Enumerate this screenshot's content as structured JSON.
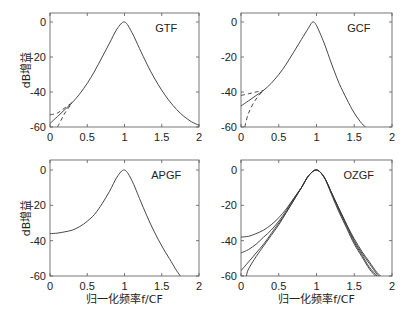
{
  "chart_data": [
    {
      "type": "line",
      "title": "GTF",
      "xlabel": "",
      "ylabel": "dB增益",
      "xlim": [
        0,
        2
      ],
      "ylim": [
        -60,
        5
      ],
      "xticks": [
        "0",
        "0.5",
        "1",
        "1.5",
        "2"
      ],
      "yticks": [
        "0",
        "-20",
        "-40",
        "-60"
      ],
      "grid": false,
      "series": [
        {
          "name": "solid",
          "style": "solid",
          "x": [
            0,
            0.1,
            0.2,
            0.3,
            0.4,
            0.5,
            0.6,
            0.7,
            0.8,
            0.9,
            1.0,
            1.1,
            1.2,
            1.3,
            1.4,
            1.5,
            1.6,
            1.7,
            1.8,
            1.9,
            2.0
          ],
          "y": [
            -58,
            -54,
            -50,
            -46,
            -41,
            -35,
            -28,
            -20,
            -12,
            -4,
            0,
            -6,
            -15,
            -24,
            -32,
            -39,
            -45,
            -50,
            -54,
            -57,
            -59
          ]
        },
        {
          "name": "dashed-1",
          "style": "dashed",
          "x": [
            0,
            0.1,
            0.2,
            0.3
          ],
          "y": [
            -53,
            -52,
            -49,
            -46
          ]
        },
        {
          "name": "dashed-2",
          "style": "dashed",
          "x": [
            0.1,
            0.15,
            0.2,
            0.3
          ],
          "y": [
            -60,
            -56,
            -52,
            -46
          ]
        }
      ]
    },
    {
      "type": "line",
      "title": "GCF",
      "xlabel": "",
      "ylabel": "",
      "xlim": [
        0,
        2
      ],
      "ylim": [
        -60,
        5
      ],
      "xticks": [
        "0",
        "0.5",
        "1",
        "1.5",
        "2"
      ],
      "yticks": [
        "0",
        "-20",
        "-40",
        "-60"
      ],
      "grid": false,
      "series": [
        {
          "name": "solid",
          "style": "solid",
          "x": [
            0,
            0.1,
            0.2,
            0.3,
            0.4,
            0.5,
            0.6,
            0.7,
            0.8,
            0.9,
            0.95,
            1.0,
            1.1,
            1.2,
            1.3,
            1.4,
            1.5,
            1.6,
            1.65
          ],
          "y": [
            -48,
            -45,
            -42,
            -39,
            -35,
            -30,
            -24,
            -17,
            -10,
            -3,
            0,
            -2,
            -12,
            -24,
            -35,
            -44,
            -52,
            -58,
            -60
          ]
        },
        {
          "name": "dashed-1",
          "style": "dashed",
          "x": [
            0,
            0.1,
            0.2,
            0.3
          ],
          "y": [
            -42,
            -41,
            -40,
            -39
          ]
        },
        {
          "name": "dashed-2",
          "style": "dashed",
          "x": [
            0.05,
            0.1,
            0.2,
            0.3
          ],
          "y": [
            -60,
            -52,
            -44,
            -39
          ]
        }
      ]
    },
    {
      "type": "line",
      "title": "APGF",
      "xlabel": "归一化频率f/CF",
      "ylabel": "dB增益",
      "xlim": [
        0,
        2
      ],
      "ylim": [
        -60,
        5
      ],
      "xticks": [
        "0",
        "0.5",
        "1",
        "1.5",
        "2"
      ],
      "yticks": [
        "0",
        "-20",
        "-40",
        "-60"
      ],
      "grid": false,
      "series": [
        {
          "name": "solid",
          "style": "solid",
          "x": [
            0,
            0.1,
            0.2,
            0.3,
            0.4,
            0.5,
            0.6,
            0.7,
            0.8,
            0.9,
            1.0,
            1.1,
            1.2,
            1.3,
            1.4,
            1.5,
            1.6,
            1.7,
            1.75
          ],
          "y": [
            -36,
            -35.7,
            -35,
            -34,
            -32,
            -29,
            -25,
            -19,
            -12,
            -4,
            0,
            -6,
            -16,
            -26,
            -35,
            -43,
            -50,
            -57,
            -60
          ]
        }
      ]
    },
    {
      "type": "line",
      "title": "OZGF",
      "xlabel": "归一化频率f/CF",
      "ylabel": "",
      "xlim": [
        0,
        2
      ],
      "ylim": [
        -60,
        5
      ],
      "xticks": [
        "0",
        "0.5",
        "1",
        "1.5",
        "2"
      ],
      "yticks": [
        "0",
        "-20",
        "-40",
        "-60"
      ],
      "grid": false,
      "series": [
        {
          "name": "curve-1",
          "style": "solid",
          "x": [
            0,
            0.1,
            0.2,
            0.3,
            0.4,
            0.5,
            0.6,
            0.7,
            0.8,
            0.9,
            1.0,
            1.1,
            1.2,
            1.3,
            1.4,
            1.5,
            1.6,
            1.7,
            1.8,
            1.85
          ],
          "y": [
            -38,
            -37.5,
            -36,
            -34,
            -31,
            -27,
            -22,
            -16,
            -10,
            -3,
            0,
            -4,
            -13,
            -22,
            -31,
            -39,
            -46,
            -52,
            -58,
            -60
          ]
        },
        {
          "name": "curve-2",
          "style": "solid",
          "x": [
            0,
            0.1,
            0.2,
            0.3,
            0.4,
            0.5,
            0.6,
            0.7,
            0.8,
            0.9,
            1.0,
            1.1,
            1.2,
            1.3,
            1.4,
            1.5,
            1.6,
            1.7,
            1.8,
            1.83
          ],
          "y": [
            -47,
            -45,
            -42,
            -38,
            -34,
            -29,
            -23,
            -16,
            -10,
            -3,
            0,
            -4,
            -13,
            -22,
            -31,
            -40,
            -47,
            -53,
            -59,
            -60
          ]
        },
        {
          "name": "curve-3",
          "style": "solid",
          "x": [
            0,
            0.1,
            0.2,
            0.3,
            0.4,
            0.5,
            0.6,
            0.7,
            0.8,
            0.9,
            1.0,
            1.1,
            1.2,
            1.3,
            1.4,
            1.5,
            1.6,
            1.7,
            1.8
          ],
          "y": [
            -57,
            -52,
            -47,
            -42,
            -36,
            -30,
            -24,
            -17,
            -10,
            -3,
            0,
            -4,
            -13,
            -23,
            -32,
            -41,
            -48,
            -55,
            -60
          ]
        },
        {
          "name": "curve-4",
          "style": "solid",
          "x": [
            0.07,
            0.1,
            0.2,
            0.3,
            0.4,
            0.5,
            0.6,
            0.7,
            0.8,
            0.9,
            1.0,
            1.1,
            1.2,
            1.3,
            1.4,
            1.5,
            1.6,
            1.7,
            1.78
          ],
          "y": [
            -60,
            -56,
            -49,
            -43,
            -37,
            -31,
            -24,
            -17,
            -10,
            -3,
            0,
            -4,
            -14,
            -24,
            -33,
            -42,
            -49,
            -56,
            -60
          ]
        }
      ]
    }
  ]
}
